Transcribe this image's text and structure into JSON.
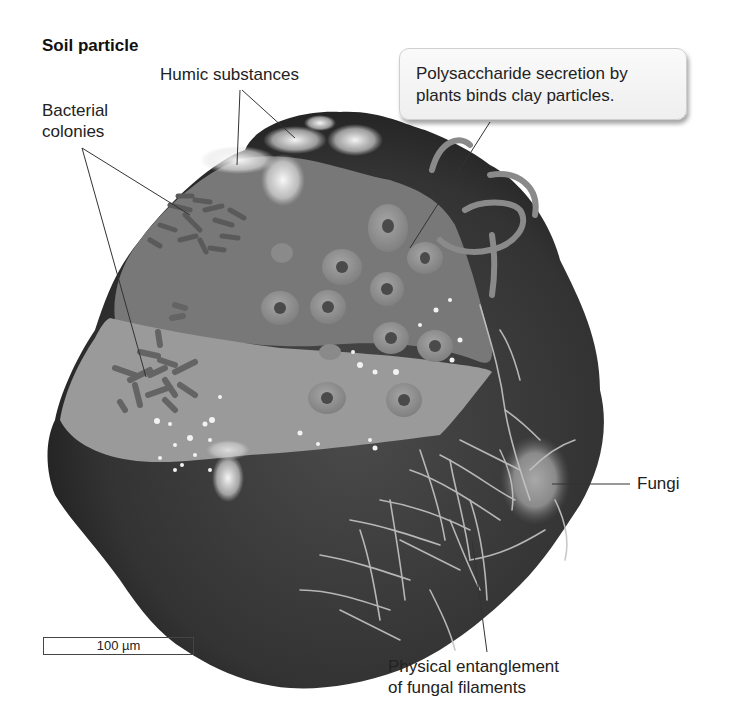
{
  "title": "Soil particle",
  "labels": {
    "humic": "Humic substances",
    "bacterial_line1": "Bacterial",
    "bacterial_line2": "colonies",
    "callout_line1": "Polysaccharide secretion by",
    "callout_line2": "plants binds clay particles.",
    "fungi": "Fungi",
    "entangle_line1": "Physical entanglement",
    "entangle_line2": "of fungal filaments"
  },
  "scale_bar": {
    "label": "100 µm"
  },
  "colors": {
    "particle_dark": "#3a3a3a",
    "clay_upper": "#7a7a7a",
    "clay_lower": "#9a9a9a",
    "cell": "#8e8e8e",
    "nucleus": "#4a4a4a",
    "hyphae": "#c8c8c8"
  }
}
